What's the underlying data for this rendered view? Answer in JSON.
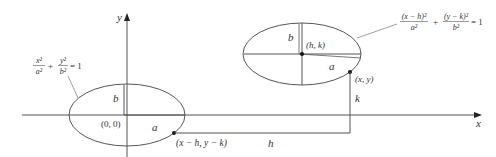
{
  "diagram": {
    "axes": {
      "x_label": "x",
      "y_label": "y"
    },
    "left_ellipse": {
      "equation": {
        "t1_num": "x²",
        "t1_den": "a²",
        "plus": "+",
        "t2_num": "y²",
        "t2_den": "b²",
        "rhs": "= 1"
      },
      "center_label": "(0, 0)",
      "a_label": "a",
      "b_label": "b",
      "point_label": "(x − h, y − k)"
    },
    "right_ellipse": {
      "equation": {
        "t1_num": "(x − h)²",
        "t1_den": "a²",
        "plus": "+",
        "t2_num": "(y − k)²",
        "t2_den": "b²",
        "rhs": "= 1"
      },
      "center_label": "(h, k)",
      "a_label": "a",
      "b_label": "b",
      "point_label": "(x, y)"
    },
    "translation": {
      "h_label": "h",
      "k_label": "k"
    },
    "colors": {
      "line": "#555555",
      "point": "#111111",
      "text": "#333333"
    }
  }
}
